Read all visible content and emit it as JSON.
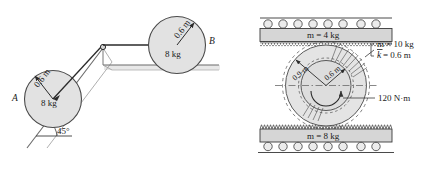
{
  "figure": {
    "colors": {
      "body_fill": "#e2e2e2",
      "body_fill_dark": "#d6d6d6",
      "outline": "#3a3a3a",
      "line": "#4a4a4a",
      "text": "#1a1a1a",
      "shadow": "#cfcfcf"
    }
  },
  "left_diagram": {
    "name": "incline-pulley-disks",
    "disk_a": {
      "label": "A",
      "radius_label": "0.6 m",
      "mass_label": "8 kg"
    },
    "disk_b": {
      "label": "B",
      "radius_label": "0.6 m",
      "mass_label": "8 kg"
    },
    "incline": {
      "angle_label": "45°"
    }
  },
  "right_diagram": {
    "name": "double-gear-rack-assembly",
    "top_rack": {
      "mass_label": "m = 4 kg"
    },
    "bottom_rack": {
      "mass_label": "m = 8 kg"
    },
    "gear": {
      "outer_radius_label": "0.9 m",
      "inner_radius_label": "0.6 m",
      "mass_label": "m = 10 kg",
      "radius_of_gyration_label": "k = 0.6 m",
      "radius_of_gyration_symbol": "k",
      "radius_of_gyration_value": " = 0.6 m",
      "torque_label": "120 N·m"
    }
  }
}
